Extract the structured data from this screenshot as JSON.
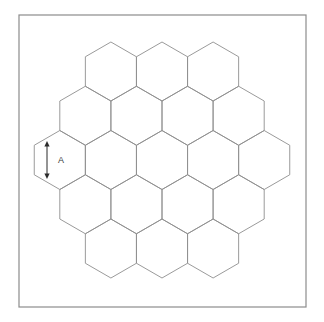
{
  "figure": {
    "kind": "honeycomb-hexagon-grid-diagram",
    "background_color": "#ffffff",
    "border": {
      "name": "figure-frame",
      "x": 19,
      "y": 15,
      "width": 287,
      "height": 292,
      "stroke_color": "#8c8c8c",
      "stroke_width": 1.2,
      "fill": "none"
    },
    "grid": {
      "orientation": "pointy-top",
      "row_counts": [
        3,
        4,
        5,
        4,
        3
      ],
      "hexagon_count": 19,
      "center_x": 162,
      "center_y": 160,
      "circumradius": 29.5,
      "side_length": 29.5,
      "hex_width": 51.1,
      "hex_height": 59,
      "row_pitch": 44.25,
      "stroke_color": "#8f8f8f",
      "stroke_width": 0.9,
      "fill": "none"
    },
    "annotation": {
      "name": "dimension-A",
      "label": "A",
      "label_x": 61,
      "label_y": 161,
      "arrow_x": 47,
      "arrow_y_top": 141,
      "arrow_y_bottom": 179,
      "arrow_color": "#2b2b2b",
      "arrow_stroke_width": 1.0,
      "arrowhead_half_width": 2.6,
      "arrowhead_length": 5.5,
      "describes": "vertical side length of leftmost middle-row hexagon"
    }
  }
}
